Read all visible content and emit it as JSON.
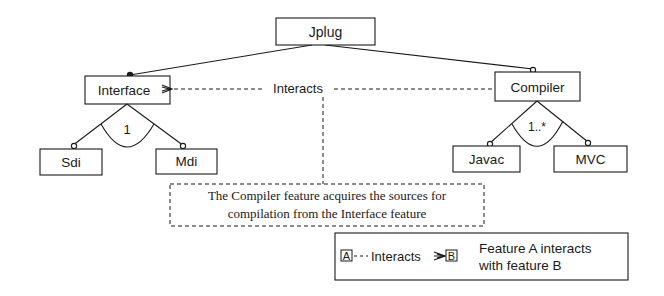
{
  "diagram": {
    "colors": {
      "ink": "#1a1a1a",
      "background": "#ffffff"
    },
    "nodes": {
      "root": {
        "label": "Jplug"
      },
      "interface": {
        "label": "Interface",
        "attachment": "mandatory"
      },
      "compiler": {
        "label": "Compiler",
        "attachment": "optional"
      },
      "sdi": {
        "label": "Sdi",
        "attachment": "optional"
      },
      "mdi": {
        "label": "Mdi",
        "attachment": "optional"
      },
      "javac": {
        "label": "Javac",
        "attachment": "optional"
      },
      "mvc": {
        "label": "MVC",
        "attachment": "optional"
      }
    },
    "groups": {
      "interface_group": {
        "cardinality": "1"
      },
      "compiler_group": {
        "cardinality": "1..*"
      }
    },
    "relation": {
      "label": "Interacts",
      "from": "Compiler",
      "to": "Interface"
    },
    "note": {
      "line1": "The Compiler feature acquires the sources for",
      "line2": "compilation from the Interface feature"
    },
    "legend": {
      "box_a": "A",
      "relation_label": "Interacts",
      "box_b": "B",
      "description_line1": "Feature A interacts",
      "description_line2": "with feature B"
    }
  }
}
